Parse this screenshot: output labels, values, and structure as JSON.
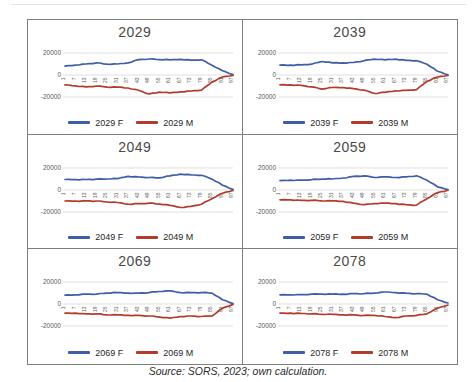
{
  "source_note": "Source: SORS, 2023; own calculation.",
  "colors": {
    "female": "#3f5ea7",
    "male": "#b23b2c",
    "grid": "#d2d2d2",
    "axis_text": "#595959",
    "title_text": "#4a4a4a",
    "panel_border": "#7f7f7f",
    "legend_text": "#1f1f1f",
    "background": "#ffffff"
  },
  "axis": {
    "y_ticks": [
      "20000",
      "0",
      "-20000"
    ],
    "ylim": [
      -25000,
      25000
    ],
    "grid": true,
    "legend_position": "bottom"
  },
  "chart_data": [
    {
      "type": "line",
      "title": "2029",
      "ylim": [
        -25000,
        25000
      ],
      "yticks": [
        "20000",
        "0",
        "-20000"
      ],
      "categories": [
        "1",
        "7",
        "13",
        "19",
        "25",
        "31",
        "37",
        "43",
        "49",
        "55",
        "61",
        "67",
        "73",
        "79",
        "85",
        "91",
        "97"
      ],
      "series": [
        {
          "name": "2029 F",
          "color_key": "female",
          "values": [
            8000,
            9000,
            10000,
            11000,
            9800,
            10000,
            11000,
            14000,
            14500,
            14000,
            13800,
            14200,
            13500,
            13800,
            8800,
            3800,
            400
          ]
        },
        {
          "name": "2029 M",
          "color_key": "male",
          "values": [
            -9000,
            -9800,
            -10800,
            -10000,
            -11000,
            -11000,
            -11800,
            -13800,
            -17300,
            -15600,
            -16200,
            -15300,
            -14500,
            -13800,
            -6500,
            -1800,
            -300
          ]
        }
      ]
    },
    {
      "type": "line",
      "title": "2039",
      "ylim": [
        -25000,
        25000
      ],
      "yticks": [
        "20000",
        "0",
        "-20000"
      ],
      "categories": [
        "1",
        "7",
        "13",
        "19",
        "25",
        "31",
        "37",
        "43",
        "49",
        "55",
        "61",
        "67",
        "73",
        "79",
        "85",
        "91",
        "97"
      ],
      "series": [
        {
          "name": "2039 F",
          "color_key": "female",
          "values": [
            9000,
            9000,
            9300,
            9800,
            12300,
            11000,
            11000,
            11400,
            13000,
            14400,
            13800,
            14400,
            13400,
            13000,
            9800,
            3400,
            300
          ]
        },
        {
          "name": "2039 M",
          "color_key": "male",
          "values": [
            -9000,
            -9000,
            -9400,
            -10800,
            -12800,
            -11400,
            -11400,
            -12400,
            -13800,
            -16800,
            -15800,
            -14400,
            -13900,
            -13400,
            -5800,
            -1800,
            -300
          ]
        }
      ]
    },
    {
      "type": "line",
      "title": "2049",
      "ylim": [
        -25000,
        25000
      ],
      "yticks": [
        "20000",
        "0",
        "-20000"
      ],
      "categories": [
        "1",
        "7",
        "13",
        "19",
        "25",
        "31",
        "37",
        "43",
        "49",
        "55",
        "61",
        "67",
        "73",
        "79",
        "85",
        "91",
        "97"
      ],
      "series": [
        {
          "name": "2049 F",
          "color_key": "female",
          "values": [
            9500,
            9500,
            9500,
            9800,
            10000,
            10400,
            12400,
            11900,
            11400,
            11000,
            12900,
            14400,
            13800,
            13400,
            9900,
            4400,
            500
          ]
        },
        {
          "name": "2049 M",
          "color_key": "male",
          "values": [
            -10000,
            -10000,
            -9900,
            -10000,
            -10900,
            -11400,
            -12900,
            -12400,
            -11900,
            -12900,
            -13900,
            -15900,
            -14900,
            -12900,
            -7900,
            -2900,
            -400
          ]
        }
      ]
    },
    {
      "type": "line",
      "title": "2059",
      "ylim": [
        -25000,
        25000
      ],
      "yticks": [
        "20000",
        "0",
        "-20000"
      ],
      "categories": [
        "1",
        "7",
        "13",
        "19",
        "25",
        "31",
        "37",
        "43",
        "49",
        "55",
        "61",
        "67",
        "73",
        "79",
        "85",
        "91",
        "97"
      ],
      "series": [
        {
          "name": "2059 F",
          "color_key": "female",
          "values": [
            8500,
            8900,
            9000,
            9400,
            9900,
            10000,
            10900,
            12400,
            12900,
            11400,
            11900,
            11400,
            11900,
            12900,
            8900,
            2900,
            400
          ]
        },
        {
          "name": "2059 M",
          "color_key": "male",
          "values": [
            -8900,
            -8900,
            -9400,
            -9400,
            -9900,
            -9900,
            -10400,
            -11900,
            -13400,
            -12400,
            -11900,
            -12400,
            -13400,
            -13700,
            -7900,
            -2400,
            -300
          ]
        }
      ]
    },
    {
      "type": "line",
      "title": "2069",
      "ylim": [
        -25000,
        25000
      ],
      "yticks": [
        "20000",
        "0",
        "-20000"
      ],
      "categories": [
        "1",
        "7",
        "13",
        "19",
        "25",
        "31",
        "37",
        "43",
        "49",
        "55",
        "61",
        "67",
        "73",
        "79",
        "85",
        "91",
        "97"
      ],
      "series": [
        {
          "name": "2069 F",
          "color_key": "female",
          "values": [
            8000,
            8400,
            8900,
            9000,
            9900,
            10400,
            9900,
            9900,
            10400,
            11400,
            11900,
            10400,
            10400,
            10400,
            9900,
            3900,
            400
          ]
        },
        {
          "name": "2069 M",
          "color_key": "male",
          "values": [
            -8400,
            -8400,
            -8900,
            -9000,
            -9900,
            -9900,
            -10400,
            -10400,
            -10900,
            -11900,
            -12900,
            -11400,
            -10900,
            -11400,
            -10900,
            -3900,
            -400
          ]
        }
      ]
    },
    {
      "type": "line",
      "title": "2078",
      "ylim": [
        -25000,
        25000
      ],
      "yticks": [
        "20000",
        "0",
        "-20000"
      ],
      "categories": [
        "1",
        "7",
        "13",
        "19",
        "25",
        "31",
        "37",
        "43",
        "49",
        "55",
        "61",
        "67",
        "73",
        "79",
        "85",
        "91",
        "97"
      ],
      "series": [
        {
          "name": "2078 F",
          "color_key": "female",
          "values": [
            8400,
            8400,
            8500,
            8900,
            9000,
            9000,
            9000,
            9400,
            9400,
            9900,
            10900,
            10400,
            9900,
            9400,
            8900,
            3900,
            900
          ]
        },
        {
          "name": "2078 M",
          "color_key": "male",
          "values": [
            -8400,
            -8400,
            -8500,
            -8900,
            -9400,
            -9400,
            -9900,
            -9900,
            -10400,
            -10400,
            -11400,
            -12400,
            -10900,
            -10400,
            -8900,
            -3900,
            -900
          ]
        }
      ]
    }
  ]
}
